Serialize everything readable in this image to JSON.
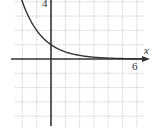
{
  "chart_data": {
    "type": "line",
    "title": "",
    "xlabel": "x",
    "ylabel": "",
    "xlim": [
      -2.5,
      6.5
    ],
    "ylim": [
      -4.8,
      4.2
    ],
    "grid": true,
    "tick_labels": {
      "x": [
        "6"
      ],
      "y": [
        "4"
      ]
    },
    "series": [
      {
        "name": "f(x) = 2^(-x)",
        "function": "2^(-x)",
        "x": [
          -2.1,
          -2,
          -1.5,
          -1,
          -0.5,
          0,
          0.5,
          1,
          2,
          3,
          4,
          5,
          6,
          6.5
        ],
        "values": [
          4.29,
          4,
          2.83,
          2,
          1.41,
          1,
          0.71,
          0.5,
          0.25,
          0.125,
          0.0625,
          0.03125,
          0.0156,
          0.011
        ]
      }
    ],
    "legend": "none"
  },
  "labels": {
    "x_axis": "x",
    "x_tick": "6",
    "y_tick": "4"
  }
}
